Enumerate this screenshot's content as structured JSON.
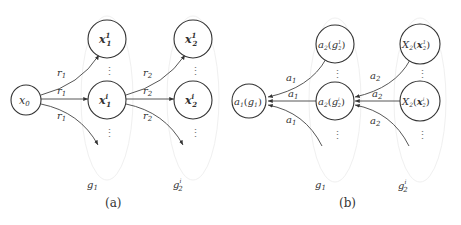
{
  "figure": {
    "panel_a": {
      "caption": "(a)",
      "nodes": {
        "x0": {
          "base": "x",
          "sub": "0"
        },
        "x1_top": {
          "base": "x",
          "sup": "1",
          "sub": "1"
        },
        "x1_mid": {
          "base": "x",
          "sup": "i",
          "sub": "1"
        },
        "x2_top": {
          "base": "x",
          "sup": "1",
          "sub": "2"
        },
        "x2_mid": {
          "base": "x",
          "sup": "i",
          "sub": "2"
        }
      },
      "edge_labels": {
        "r1_base": "r",
        "r1_sub": "1",
        "r2_base": "r",
        "r2_sub": "2"
      },
      "group_labels": {
        "g1_base": "g",
        "g1_sub": "1",
        "g2_base": "g",
        "g2_sub": "2",
        "g2_sup": "i"
      },
      "ellipsis": "⋮"
    },
    "panel_b": {
      "caption": "(b)",
      "nodes": {
        "a1g1": {
          "fn": "a",
          "fn_sub": "1",
          "arg": "g",
          "arg_sub": "1"
        },
        "a2g2_top": {
          "fn": "a",
          "fn_sub": "2",
          "arg": "g",
          "arg_sub": "2",
          "arg_sup": "1"
        },
        "a2g2_mid": {
          "fn": "a",
          "fn_sub": "2",
          "arg": "g",
          "arg_sub": "2",
          "arg_sup": "i"
        },
        "X2x2_top": {
          "fn": "X",
          "fn_sub": "2",
          "arg": "x",
          "arg_sub": "2",
          "arg_sup": "1"
        },
        "X2x2_mid": {
          "fn": "X",
          "fn_sub": "2",
          "arg": "x",
          "arg_sub": "2",
          "arg_sup": "i"
        }
      },
      "edge_labels": {
        "a1_base": "a",
        "a1_sub": "1",
        "a2_base": "a",
        "a2_sub": "2"
      },
      "group_labels": {
        "g1_base": "g",
        "g1_sub": "1",
        "g2_base": "g",
        "g2_sub": "2",
        "g2_sup": "i"
      },
      "ellipsis": "⋮",
      "open_paren": "(",
      "close_paren": ")"
    }
  }
}
